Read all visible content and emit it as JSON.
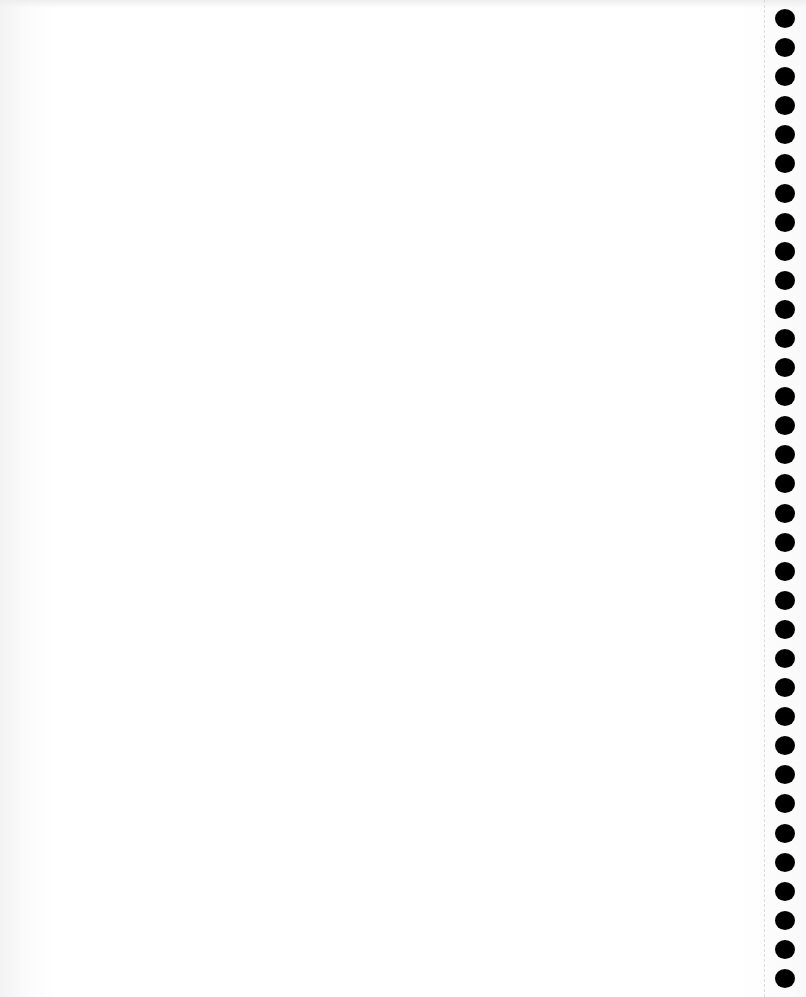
{
  "document": {
    "type": "blank notebook page",
    "content_text": "",
    "background_color": "#ffffff"
  },
  "binding": {
    "style": "spiral-punched holes",
    "side": "right",
    "hole_count": 34,
    "hole_color": "#000000",
    "perforation_line": "dashed"
  }
}
